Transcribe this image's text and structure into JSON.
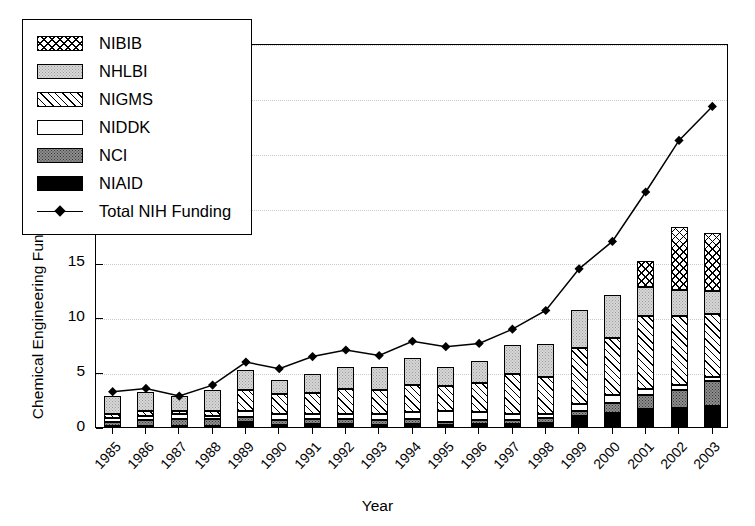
{
  "chart_data": {
    "type": "bar",
    "stacked": true,
    "title": "",
    "xlabel": "Year",
    "ylabel": "Chemical Engineering Funding (Millions U.S. Dollars)",
    "ylim": [
      0,
      35
    ],
    "yticks": [
      0,
      5,
      10,
      15,
      20,
      25,
      30,
      35
    ],
    "grid": true,
    "legend_position": "upper-left",
    "categories": [
      "1985",
      "1986",
      "1987",
      "1988",
      "1989",
      "1990",
      "1991",
      "1992",
      "1993",
      "1994",
      "1995",
      "1996",
      "1997",
      "1998",
      "1999",
      "2000",
      "2001",
      "2002",
      "2003"
    ],
    "series": [
      {
        "name": "NIAID",
        "pattern": "solid-black",
        "values": [
          0.1,
          0.1,
          0.1,
          0.1,
          0.5,
          0.2,
          0.3,
          0.3,
          0.2,
          0.3,
          0.2,
          0.3,
          0.3,
          0.4,
          1.0,
          1.3,
          1.6,
          1.7,
          1.9
        ]
      },
      {
        "name": "NCI",
        "pattern": "dark-stipple",
        "values": [
          0.4,
          0.5,
          0.6,
          0.6,
          0.4,
          0.4,
          0.4,
          0.4,
          0.4,
          0.4,
          0.3,
          0.3,
          0.3,
          0.4,
          0.5,
          0.9,
          1.3,
          1.7,
          2.3
        ]
      },
      {
        "name": "NIDDK",
        "pattern": "white",
        "values": [
          0.3,
          0.4,
          0.5,
          0.3,
          0.6,
          0.6,
          0.5,
          0.5,
          0.6,
          0.7,
          1.0,
          0.8,
          0.6,
          0.4,
          0.6,
          0.7,
          0.6,
          0.4,
          0.4
        ]
      },
      {
        "name": "NIGMS",
        "pattern": "diagonal-hatch",
        "values": [
          0.4,
          0.5,
          0.3,
          0.5,
          1.9,
          1.8,
          1.9,
          2.3,
          2.2,
          2.4,
          2.2,
          2.6,
          3.6,
          3.4,
          5.1,
          5.2,
          6.6,
          6.3,
          5.7
        ]
      },
      {
        "name": "NHLBI",
        "pattern": "light-stipple",
        "values": [
          1.6,
          1.7,
          1.3,
          1.9,
          1.8,
          1.3,
          1.7,
          2.0,
          2.1,
          2.5,
          1.8,
          2.0,
          2.7,
          3.0,
          3.5,
          3.9,
          2.7,
          2.4,
          2.1
        ]
      },
      {
        "name": "NIBIB",
        "pattern": "cross-hatch",
        "values": [
          0,
          0,
          0,
          0,
          0,
          0,
          0,
          0,
          0,
          0,
          0,
          0,
          0,
          0,
          0,
          0,
          2.3,
          5.7,
          5.3
        ]
      }
    ],
    "totals_bar": [
      2.8,
      3.2,
      2.8,
      3.4,
      5.2,
      4.3,
      4.8,
      5.5,
      5.5,
      6.3,
      5.5,
      6.0,
      7.5,
      7.6,
      10.7,
      12.0,
      15.1,
      18.2,
      17.7
    ],
    "line_series": {
      "name": "Total NIH Funding",
      "marker": "filled-diamond",
      "values": [
        3.4,
        3.7,
        3.0,
        4.0,
        6.1,
        5.5,
        6.6,
        7.2,
        6.7,
        8.0,
        7.5,
        7.8,
        9.1,
        10.8,
        14.6,
        17.1,
        21.6,
        26.3,
        29.4
      ]
    }
  },
  "legend": {
    "items": [
      {
        "label": "NIBIB",
        "pattern": "cross-hatch"
      },
      {
        "label": "NHLBI",
        "pattern": "light-stipple"
      },
      {
        "label": "NIGMS",
        "pattern": "diagonal-hatch"
      },
      {
        "label": "NIDDK",
        "pattern": "white"
      },
      {
        "label": "NCI",
        "pattern": "dark-stipple"
      },
      {
        "label": "NIAID",
        "pattern": "solid-black"
      },
      {
        "label": "Total NIH Funding",
        "pattern": "line-diamond"
      }
    ]
  },
  "colors": {
    "axis": "#000000",
    "grid": "#c9c9c9",
    "niaid": "#000000",
    "nci": "#8d8d8d",
    "niddk": "#ffffff",
    "nigms": "#ffffff",
    "nhlbi": "#d8d8d8",
    "nibib": "#ffffff"
  }
}
